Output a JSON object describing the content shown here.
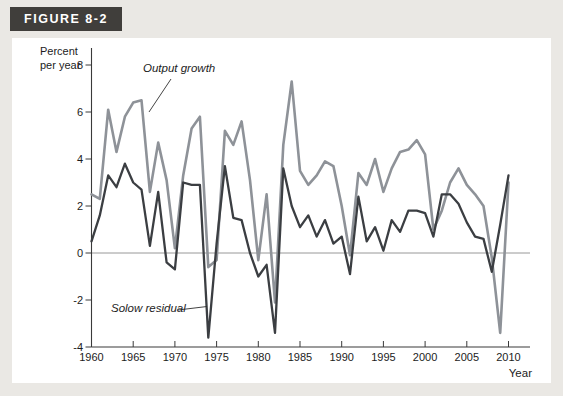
{
  "figure_label": "FIGURE 8-2",
  "y_axis": {
    "title_lines": [
      "Percent",
      "per year"
    ],
    "tick_labels": [
      "8",
      "6",
      "4",
      "2",
      "0",
      "-2",
      "-4"
    ],
    "tick_values": [
      8,
      6,
      4,
      2,
      0,
      -2,
      -4
    ]
  },
  "x_axis": {
    "title": "Year",
    "tick_labels": [
      "1960",
      "1965",
      "1970",
      "1975",
      "1980",
      "1985",
      "1990",
      "1995",
      "2000",
      "2005",
      "2010"
    ],
    "tick_values": [
      1960,
      1965,
      1970,
      1975,
      1980,
      1985,
      1990,
      1995,
      2000,
      2005,
      2010
    ]
  },
  "annotations": {
    "output_growth": "Output growth",
    "solow_residual": "Solow residual"
  },
  "colors": {
    "output_growth_line": "#8e9298",
    "solow_residual_line": "#3b3e42",
    "axis": "#3a3a3a",
    "zero_line": "#8c8c8c",
    "header_bg": "#403e3b",
    "header_text": "#ffffff",
    "page_bg": "#eae8e4",
    "panel_bg": "#ffffff",
    "tick_text": "#1c1c1c"
  },
  "chart_data": {
    "type": "line",
    "title": "FIGURE 8-2",
    "xlabel": "Year",
    "ylabel": "Percent per year",
    "xlim": [
      1960,
      2013
    ],
    "ylim": [
      -4,
      8
    ],
    "grid": "zero-line-only",
    "legend_position": "inline-annotations",
    "x": [
      1960,
      1961,
      1962,
      1963,
      1964,
      1965,
      1966,
      1967,
      1968,
      1969,
      1970,
      1971,
      1972,
      1973,
      1974,
      1975,
      1976,
      1977,
      1978,
      1979,
      1980,
      1981,
      1982,
      1983,
      1984,
      1985,
      1986,
      1987,
      1988,
      1989,
      1990,
      1991,
      1992,
      1993,
      1994,
      1995,
      1996,
      1997,
      1998,
      1999,
      2000,
      2001,
      2002,
      2003,
      2004,
      2005,
      2006,
      2007,
      2008,
      2009,
      2010
    ],
    "series": [
      {
        "name": "Output growth",
        "color": "#8e9298",
        "values": [
          2.5,
          2.3,
          6.1,
          4.3,
          5.8,
          6.4,
          6.5,
          2.6,
          4.7,
          3.1,
          0.2,
          3.3,
          5.3,
          5.8,
          -0.6,
          -0.3,
          5.2,
          4.6,
          5.6,
          3.1,
          -0.3,
          2.5,
          -2.1,
          4.6,
          7.3,
          3.5,
          2.9,
          3.3,
          3.9,
          3.7,
          2.0,
          -0.1,
          3.4,
          2.9,
          4.0,
          2.6,
          3.6,
          4.3,
          4.4,
          4.8,
          4.2,
          1.0,
          1.8,
          3.0,
          3.6,
          2.9,
          2.5,
          2.0,
          -0.2,
          -3.4,
          3.0
        ]
      },
      {
        "name": "Solow residual",
        "color": "#3b3e42",
        "values": [
          0.5,
          1.6,
          3.3,
          2.8,
          3.8,
          3.0,
          2.7,
          0.3,
          2.6,
          -0.4,
          -0.7,
          3.0,
          2.9,
          2.9,
          -3.6,
          0.4,
          3.7,
          1.5,
          1.4,
          0.0,
          -1.0,
          -0.5,
          -3.4,
          3.6,
          2.0,
          1.1,
          1.6,
          0.7,
          1.4,
          0.4,
          0.7,
          -0.9,
          2.4,
          0.5,
          1.1,
          0.1,
          1.4,
          0.9,
          1.8,
          1.8,
          1.7,
          0.7,
          2.5,
          2.5,
          2.1,
          1.3,
          0.7,
          0.6,
          -0.8,
          1.2,
          3.3
        ]
      }
    ]
  }
}
